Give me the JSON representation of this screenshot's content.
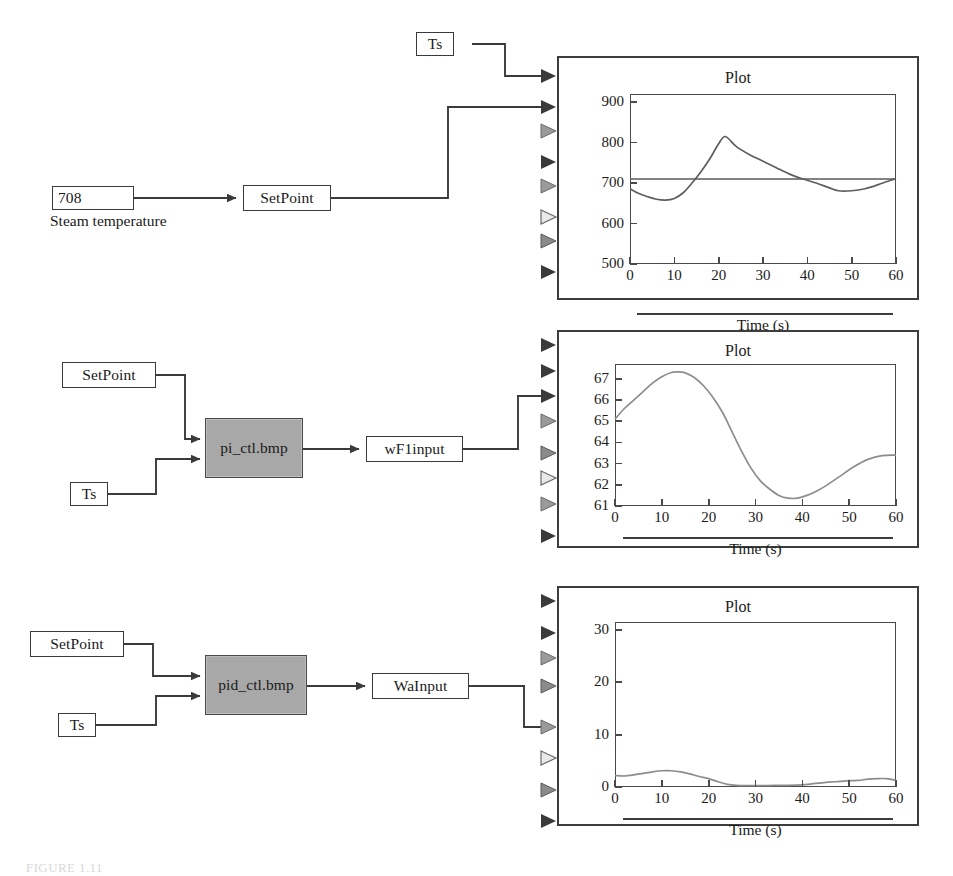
{
  "diagram": {
    "title_block_label": "Plot",
    "row1": {
      "value_block": {
        "name": "steam-temp-value",
        "text": "708"
      },
      "value_caption": "Steam temperature",
      "setpoint_block": "SetPoint",
      "ts_block": "Ts"
    },
    "row2": {
      "setpoint_block": "SetPoint",
      "ts_block": "Ts",
      "controller_block": "pi_ctl.bmp",
      "output_block": "wF1input"
    },
    "row3": {
      "setpoint_block": "SetPoint",
      "ts_block": "Ts",
      "controller_block": "pid_ctl.bmp",
      "output_block": "WaInput"
    },
    "colors": {
      "controller_fill": "#a8a8a8",
      "block_border": "#3a3a3a",
      "trace": "#8d8d8d",
      "frame": "#3d3d3d"
    },
    "port_count_per_plot": 8,
    "port_fill_pattern": [
      "filled",
      "filled",
      "hollow",
      "filled",
      "hollow",
      "hollow",
      "filled",
      "filled"
    ]
  },
  "caption": "FIGURE 1.11",
  "chart_data": [
    {
      "type": "line",
      "title": "Plot",
      "xlabel": "Time (s)",
      "ylabel": "",
      "xticks": [
        0,
        10,
        20,
        30,
        40,
        50,
        60
      ],
      "yticks": [
        500,
        600,
        700,
        800,
        900
      ],
      "xlim": [
        0,
        60
      ],
      "ylim": [
        500,
        920
      ],
      "grid": false,
      "series": [
        {
          "name": "setpoint",
          "style": "horizontal-line",
          "value": 710,
          "x": [
            0,
            60
          ],
          "values": [
            710,
            710
          ]
        },
        {
          "name": "steam temperature response",
          "x": [
            0,
            2,
            4,
            6,
            8,
            10,
            12,
            14,
            16,
            18,
            20,
            21.5,
            24,
            27,
            30,
            33,
            36,
            39,
            42,
            45,
            47,
            50,
            53,
            56,
            58,
            60
          ],
          "values": [
            686,
            674,
            666,
            660,
            658,
            662,
            676,
            700,
            728,
            760,
            797,
            815,
            790,
            770,
            754,
            738,
            722,
            710,
            700,
            688,
            681,
            681,
            686,
            696,
            704,
            711
          ]
        }
      ]
    },
    {
      "type": "line",
      "title": "Plot",
      "xlabel": "Time (s)",
      "ylabel": "",
      "xticks": [
        0,
        10,
        20,
        30,
        40,
        50,
        60
      ],
      "yticks": [
        61,
        62,
        63,
        64,
        65,
        66,
        67
      ],
      "xlim": [
        0,
        60
      ],
      "ylim": [
        61,
        67.7
      ],
      "grid": false,
      "series": [
        {
          "name": "wF1input",
          "x": [
            0,
            2,
            4,
            6,
            8,
            10,
            12,
            13.5,
            15,
            17,
            19,
            21,
            23,
            25,
            27,
            29,
            31,
            33,
            35,
            37,
            39,
            41,
            43,
            45,
            48,
            51,
            54,
            57,
            60
          ],
          "values": [
            65.1,
            65.6,
            66.0,
            66.4,
            66.8,
            67.1,
            67.3,
            67.33,
            67.28,
            67.05,
            66.65,
            66.1,
            65.4,
            64.5,
            63.6,
            62.8,
            62.2,
            61.8,
            61.5,
            61.37,
            61.37,
            61.5,
            61.7,
            61.95,
            62.4,
            62.85,
            63.2,
            63.38,
            63.4
          ]
        }
      ]
    },
    {
      "type": "line",
      "title": "Plot",
      "xlabel": "Time (s)",
      "ylabel": "",
      "xticks": [
        0,
        10,
        20,
        30,
        40,
        50,
        60
      ],
      "yticks": [
        0,
        10,
        20,
        30
      ],
      "xlim": [
        0,
        60
      ],
      "ylim": [
        0,
        31.5
      ],
      "grid": false,
      "series": [
        {
          "name": "WaInput",
          "x": [
            0,
            2,
            4,
            6,
            8,
            10,
            12,
            14,
            16,
            18,
            20,
            22,
            24,
            26,
            28,
            31,
            34,
            37,
            40,
            42,
            45,
            47,
            50,
            52,
            54,
            56,
            58,
            60
          ],
          "values": [
            2.2,
            2.1,
            2.3,
            2.6,
            2.9,
            3.1,
            3.1,
            2.9,
            2.5,
            2.0,
            1.6,
            1.0,
            0.5,
            0.3,
            0.25,
            0.25,
            0.3,
            0.3,
            0.4,
            0.6,
            0.9,
            1.0,
            1.2,
            1.25,
            1.5,
            1.6,
            1.6,
            1.3
          ]
        }
      ]
    }
  ]
}
